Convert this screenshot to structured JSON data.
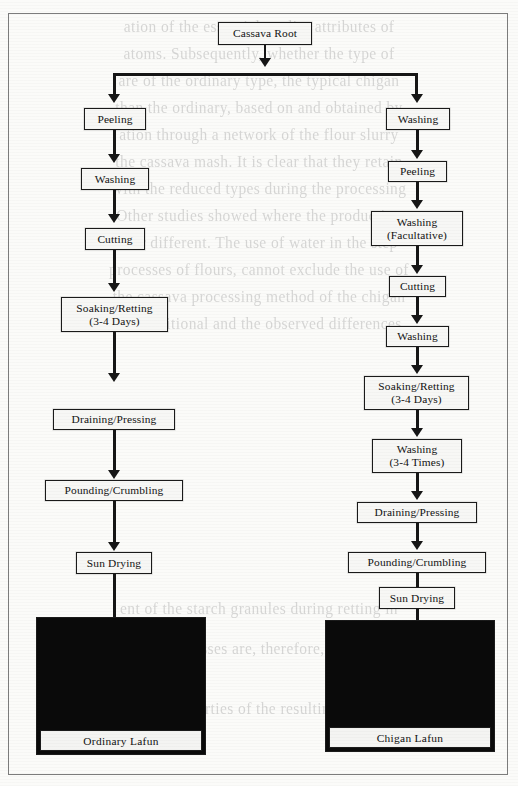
{
  "figure": {
    "root_label": "Cassava Root",
    "frame_color": "#7c7c7c",
    "box_border_color": "#1a1a1a",
    "connector_color": "#161616"
  },
  "left_branch": {
    "name": "Ordinary Lafun",
    "steps": [
      {
        "line1": "Peeling",
        "line2": ""
      },
      {
        "line1": "Washing",
        "line2": ""
      },
      {
        "line1": "Cutting",
        "line2": ""
      },
      {
        "line1": "Soaking/Retting",
        "line2": "(3-4 Days)"
      },
      {
        "line1": "Draining/Pressing",
        "line2": ""
      },
      {
        "line1": "Pounding/Crumbling",
        "line2": ""
      },
      {
        "line1": "Sun Drying",
        "line2": ""
      }
    ],
    "photo_caption": "Ordinary Lafun"
  },
  "right_branch": {
    "name": "Chigan Lafun",
    "steps": [
      {
        "line1": "Washing",
        "line2": ""
      },
      {
        "line1": "Peeling",
        "line2": ""
      },
      {
        "line1": "Washing",
        "line2": "(Facultative)"
      },
      {
        "line1": "Cutting",
        "line2": ""
      },
      {
        "line1": "Washing",
        "line2": ""
      },
      {
        "line1": "Soaking/Retting",
        "line2": "(3-4 Days)"
      },
      {
        "line1": "Washing",
        "line2": "(3-4 Times)"
      },
      {
        "line1": "Draining/Pressing",
        "line2": ""
      },
      {
        "line1": "Pounding/Crumbling",
        "line2": ""
      },
      {
        "line1": "Sun Drying",
        "line2": ""
      }
    ],
    "photo_caption": "Chigan Lafun"
  },
  "background_bleed": {
    "note": "faint mirrored show-through text from the reverse side of the scanned page",
    "lines": [
      "ation of the essential quality attributes of",
      "atoms. Subsequently, whether the type of",
      "are of the ordinary type, the typical chigan",
      "than the ordinary, based on and obtained by",
      "ation through a network of the flour slurry",
      "the cassava mash. It is clear that they retain",
      "with the reduced types during the processing",
      "Other studies showed where the production",
      "ther different. The use of water in the step",
      "processes of flours, cannot exclude the use of",
      "the cassava processing method of the chigan",
      "the traditional and the observed differences",
      "ent of the starch granules during retting in",
      "in both processes are, therefore, the same in",
      "and properties of the resulting flour."
    ]
  }
}
